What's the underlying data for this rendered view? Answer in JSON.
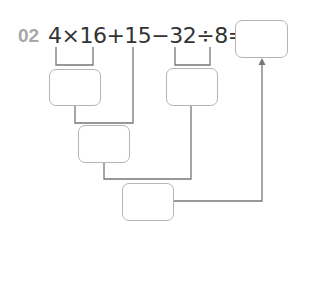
{
  "problem": {
    "number": "02",
    "expression": "4×16+15−32÷8=",
    "tokens": [
      "4",
      "×",
      "16",
      "+",
      "15",
      "−",
      "32",
      "÷",
      "8",
      "="
    ]
  },
  "boxes": [
    {
      "id": "answer",
      "value": ""
    },
    {
      "id": "product-4x16",
      "value": ""
    },
    {
      "id": "quotient-32div8",
      "value": ""
    },
    {
      "id": "sum-plus-15",
      "value": ""
    },
    {
      "id": "difference-final",
      "value": ""
    }
  ],
  "colors": {
    "number": "#a8a8a8",
    "text": "#333333",
    "lines": "#777777",
    "box_border": "#b5b5b5"
  }
}
